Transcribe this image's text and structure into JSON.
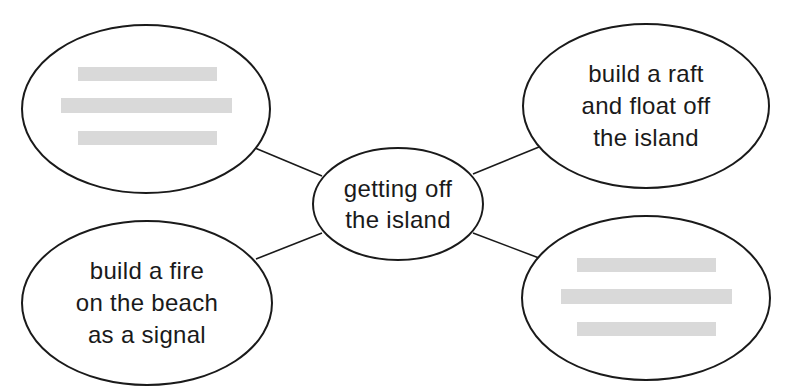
{
  "diagram": {
    "type": "concept-map",
    "colors": {
      "stroke": "#1a1a1a",
      "text": "#1a1a1a",
      "redacted_bar": "#d9d9d9",
      "background": "#ffffff"
    },
    "center": {
      "lines": [
        "getting off",
        "the island"
      ]
    },
    "nodes": {
      "top_left": {
        "redacted": true,
        "lines": []
      },
      "top_right": {
        "redacted": false,
        "lines": [
          "build a raft",
          "and float off",
          "the island"
        ]
      },
      "bottom_left": {
        "redacted": false,
        "lines": [
          "build a fire",
          "on the beach",
          "as a signal"
        ]
      },
      "bottom_right": {
        "redacted": true,
        "lines": []
      }
    }
  }
}
